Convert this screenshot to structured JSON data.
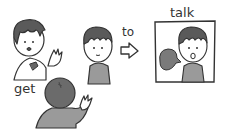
{
  "labels": {
    "get": "get",
    "to": "to",
    "talk": "talk"
  },
  "colors": {
    "outline": "#333333",
    "hair_dark": "#5a5a5a",
    "head_back": "#6b6b6b",
    "shirt": "#9a9a9a",
    "skin": "#ffffff",
    "bubble": "#7a7a7a",
    "background": "#ffffff"
  },
  "figures": [
    {
      "name": "worried-boy",
      "description": "boy with raised hand, worried expression"
    },
    {
      "name": "listener-boy",
      "description": "boy facing forward, neutral"
    },
    {
      "name": "back-view-boy",
      "description": "boy seen from behind, waving"
    },
    {
      "name": "talking-boy",
      "description": "boy in frame, speaking with speech bubble"
    }
  ],
  "icons": {
    "arrow": "right-arrow-icon",
    "speech": "speech-bubble-icon"
  }
}
